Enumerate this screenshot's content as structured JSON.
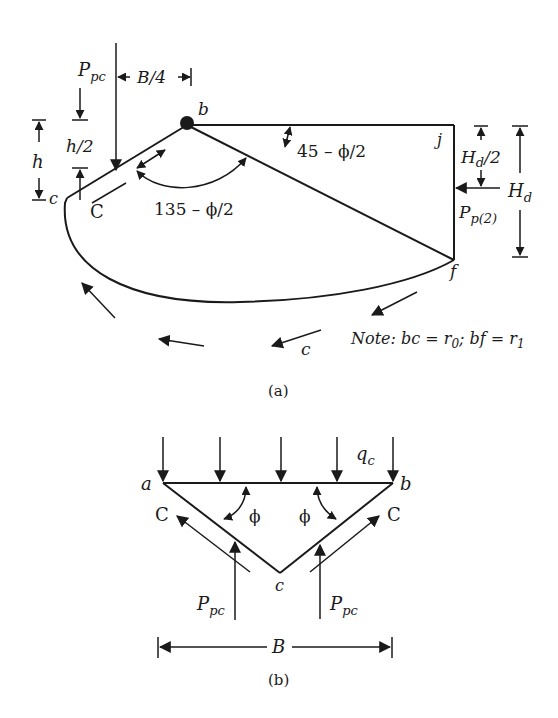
{
  "figure_a": {
    "caption": "(a)",
    "labels": {
      "p_pc": "P",
      "p_pc_sub": "pc",
      "b_quarter": "B/4",
      "point_b": "b",
      "point_c": "c",
      "point_j": "j",
      "point_f": "f",
      "cohesion_C": "C",
      "cohesion_c": "c",
      "h": "h",
      "h_half": "h/2",
      "angle_135": "135 – ϕ/2",
      "angle_45": "45 – ϕ/2",
      "hd_half_main": "H",
      "hd_half_sub": "d",
      "hd_half_tail": "/2",
      "hd_main": "H",
      "hd_sub": "d",
      "pp2_main": "P",
      "pp2_sub": "p(2)",
      "note": "Note: bc = r",
      "note_r0_sub": "0",
      "note_mid": "; bf = r",
      "note_r1_sub": "1"
    }
  },
  "figure_b": {
    "caption": "(b)",
    "labels": {
      "point_a": "a",
      "point_b": "b",
      "point_c": "c",
      "qc_main": "q",
      "qc_sub": "c",
      "phi_left": "ϕ",
      "phi_right": "ϕ",
      "cohesion_left": "C",
      "cohesion_right": "C",
      "ppc_left_main": "P",
      "ppc_left_sub": "pc",
      "ppc_right_main": "P",
      "ppc_right_sub": "pc",
      "width_B": "B"
    }
  }
}
